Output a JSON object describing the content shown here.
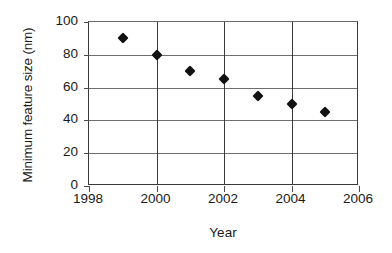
{
  "chart_data": {
    "type": "scatter",
    "title": "",
    "xlabel": "Year",
    "ylabel": "Minimum feature size (nm)",
    "x": [
      1999,
      2000,
      2001,
      2002,
      2003,
      2004,
      2005
    ],
    "values": [
      90,
      80,
      70,
      65,
      55,
      50,
      45
    ],
    "series": [
      {
        "name": "Minimum feature size",
        "points": [
          {
            "x": 1999,
            "y": 90
          },
          {
            "x": 2000,
            "y": 80
          },
          {
            "x": 2001,
            "y": 70
          },
          {
            "x": 2002,
            "y": 65
          },
          {
            "x": 2003,
            "y": 55
          },
          {
            "x": 2004,
            "y": 50
          },
          {
            "x": 2005,
            "y": 45
          }
        ]
      }
    ],
    "xlim": [
      1998,
      2006
    ],
    "ylim": [
      0,
      100
    ],
    "xticks": [
      1998,
      2000,
      2002,
      2004,
      2006
    ],
    "xtick_labels": [
      "1998",
      "2000",
      "2002",
      "2004",
      "2006"
    ],
    "yticks": [
      0,
      20,
      40,
      60,
      80,
      100
    ],
    "ytick_labels": [
      "0",
      "20",
      "40",
      "60",
      "80",
      "100"
    ],
    "grid": {
      "horizontal": true,
      "vertical": true,
      "vertical_at": [
        2000,
        2002,
        2004
      ]
    },
    "legend": "none",
    "marker": "diamond",
    "marker_color": "#111111",
    "axis_color": "#3a3a3a",
    "grid_color": "#6e6e6e",
    "background": "#ffffff"
  }
}
